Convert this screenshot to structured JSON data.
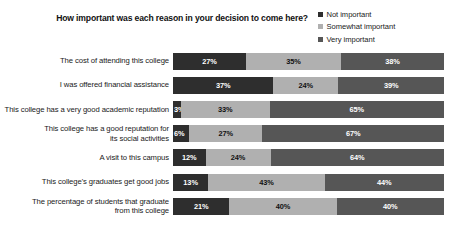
{
  "header": {
    "title": "How important was each reason in your decision to come here?"
  },
  "legend": {
    "position": "top-right",
    "items": [
      {
        "label": "Not important",
        "color": "#2e2e2e",
        "key": "not_important"
      },
      {
        "label": "Somewhat important",
        "color": "#b0b0b0",
        "key": "somewhat_important"
      },
      {
        "label": "Very important",
        "color": "#565656",
        "key": "very_important"
      }
    ]
  },
  "chart_data": {
    "type": "bar",
    "orientation": "horizontal",
    "stacked": true,
    "stack_mode": "percent",
    "title": "How important was each reason in your decision to come here?",
    "xlabel": "",
    "ylabel": "",
    "xlim": [
      0,
      100
    ],
    "grid": false,
    "value_suffix": "%",
    "categories": [
      "The cost of attending this college",
      "I was offered financial assistance",
      "This college has a very good academic reputation",
      "This college has a good reputation for its social activities",
      "A visit to this campus",
      "This college's graduates get good jobs",
      "The percentage of students that graduate from this college"
    ],
    "category_lines": [
      [
        "The cost of attending this college"
      ],
      [
        "I was offered financial assistance"
      ],
      [
        "This college has a very good academic reputation"
      ],
      [
        "This college has a good reputation for",
        "its social activities"
      ],
      [
        "A visit to this campus"
      ],
      [
        "This college's graduates get good jobs"
      ],
      [
        "The percentage of students that graduate",
        "from this college"
      ]
    ],
    "series": [
      {
        "name": "Not important",
        "color": "#2e2e2e",
        "values": [
          27,
          37,
          3,
          6,
          12,
          13,
          21
        ]
      },
      {
        "name": "Somewhat important",
        "color": "#b0b0b0",
        "values": [
          35,
          24,
          33,
          27,
          24,
          43,
          40
        ]
      },
      {
        "name": "Very important",
        "color": "#565656",
        "values": [
          38,
          39,
          65,
          67,
          64,
          44,
          40
        ]
      }
    ],
    "data_labels": [
      [
        "27%",
        "35%",
        "38%"
      ],
      [
        "37%",
        "24%",
        "39%"
      ],
      [
        "3%",
        "33%",
        "65%"
      ],
      [
        "6%",
        "27%",
        "67%"
      ],
      [
        "12%",
        "24%",
        "64%"
      ],
      [
        "13%",
        "43%",
        "44%"
      ],
      [
        "21%",
        "40%",
        "40%"
      ]
    ]
  }
}
